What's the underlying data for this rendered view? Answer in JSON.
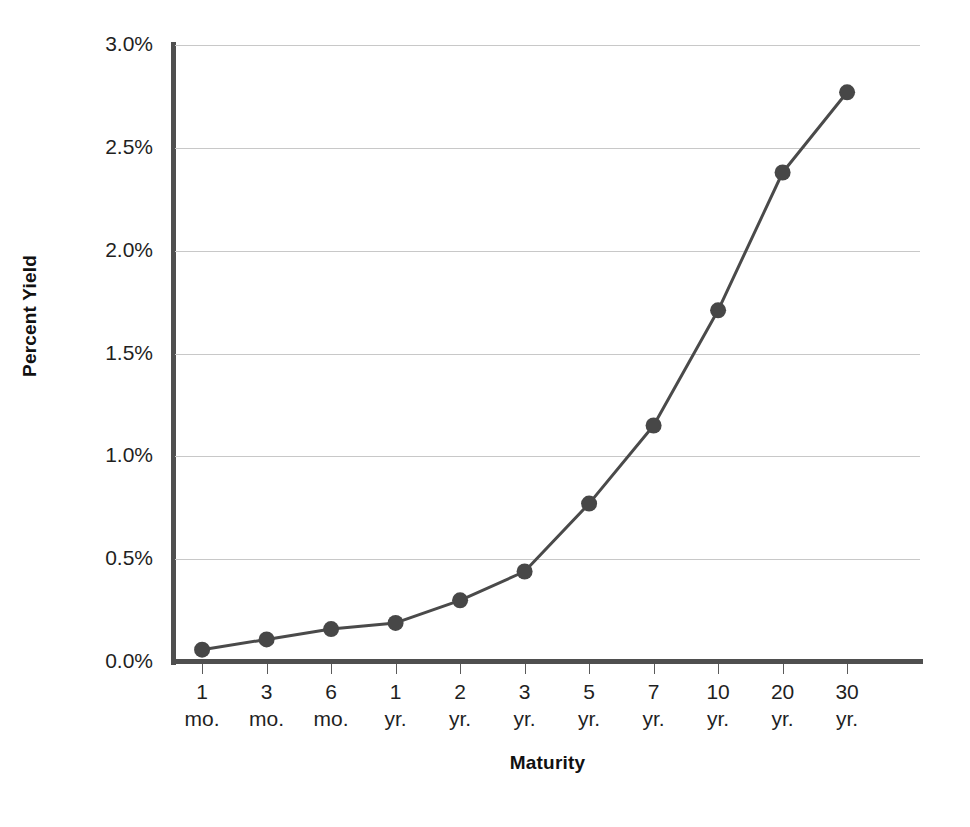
{
  "chart_data": {
    "type": "line",
    "title": "",
    "xlabel": "Maturity",
    "ylabel": "Percent Yield",
    "categories": [
      "1 mo.",
      "3 mo.",
      "6 mo.",
      "1 yr.",
      "2 yr.",
      "3 yr.",
      "5 yr.",
      "7 yr.",
      "10 yr.",
      "20 yr.",
      "30 yr."
    ],
    "category_numbers": [
      "1",
      "3",
      "6",
      "1",
      "2",
      "3",
      "5",
      "7",
      "10",
      "20",
      "30"
    ],
    "category_units": [
      "mo.",
      "mo.",
      "mo.",
      "yr.",
      "yr.",
      "yr.",
      "yr.",
      "yr.",
      "yr.",
      "yr.",
      "yr."
    ],
    "values": [
      0.06,
      0.11,
      0.16,
      0.19,
      0.3,
      0.44,
      0.77,
      1.15,
      1.71,
      2.38,
      2.77
    ],
    "value_labels": [
      "0.06%",
      "0.11%",
      "0.16%",
      "0.19%",
      "0.30%",
      "0.44%",
      "0.77%",
      "1.15%",
      "1.71%",
      "2.38%",
      "2.77%"
    ],
    "ylim": [
      0.0,
      3.0
    ],
    "ytick_values": [
      0.0,
      0.5,
      1.0,
      1.5,
      2.0,
      2.5,
      3.0
    ],
    "ytick_labels": [
      "0.0%",
      "0.5%",
      "1.0%",
      "1.5%",
      "2.0%",
      "2.5%",
      "3.0%"
    ],
    "grid": true,
    "legend": "none",
    "series": [
      {
        "name": "Treasury yield curve",
        "values": [
          0.06,
          0.11,
          0.16,
          0.19,
          0.3,
          0.44,
          0.77,
          1.15,
          1.71,
          2.38,
          2.77
        ],
        "line_color": "#4a4a4a",
        "marker_color": "#474747",
        "marker_shape": "circle"
      }
    ],
    "colors": {
      "line": "#4a4a4a",
      "marker": "#474747",
      "gridline": "#c8c8c8",
      "axis": "#4f4f4f",
      "text": "#1a1a1a",
      "background": "#ffffff"
    }
  }
}
